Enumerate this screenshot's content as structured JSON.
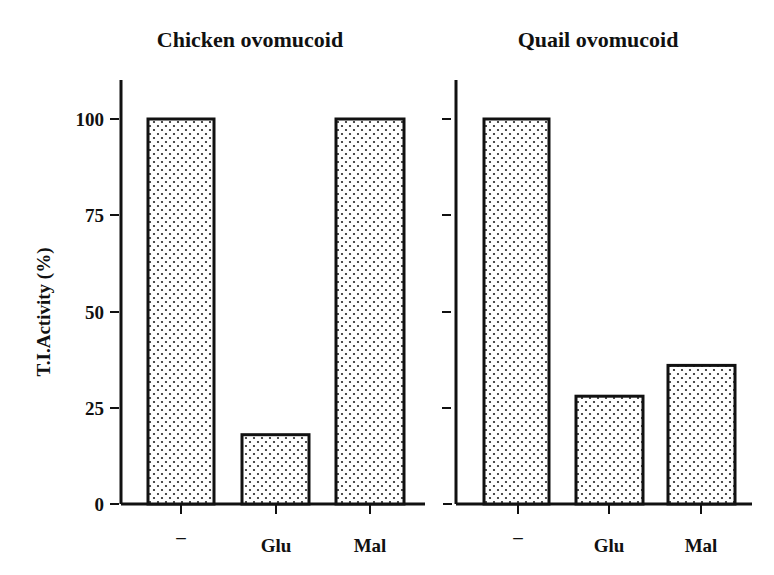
{
  "chart_data": [
    {
      "type": "bar",
      "title": "Chicken ovomucoid",
      "categories": [
        "–",
        "Glu",
        "Mal"
      ],
      "values": [
        100,
        18,
        100
      ],
      "xlabel": "",
      "ylabel": "T.I.Activity (%)",
      "ylim": [
        0,
        110
      ],
      "yticks": [
        0,
        25,
        50,
        75,
        100
      ],
      "grid": false,
      "legend": null,
      "bar_fill": "dotted"
    },
    {
      "type": "bar",
      "title": "Quail ovomucoid",
      "categories": [
        "–",
        "Glu",
        "Mal"
      ],
      "values": [
        100,
        28,
        36
      ],
      "xlabel": "",
      "ylabel": "",
      "ylim": [
        0,
        110
      ],
      "yticks": [
        0,
        25,
        50,
        75,
        100
      ],
      "grid": false,
      "legend": null,
      "bar_fill": "dotted"
    }
  ],
  "labels": {
    "left_title": "Chicken ovomucoid",
    "right_title": "Quail ovomucoid",
    "ylabel": "T.I.Activity (%)",
    "yticks": [
      "100",
      "75",
      "50",
      "25",
      "0"
    ],
    "categories": [
      "–",
      "Glu",
      "Mal"
    ]
  }
}
